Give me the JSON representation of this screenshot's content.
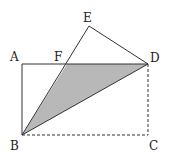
{
  "diagram": {
    "type": "geometry",
    "points": {
      "A": {
        "label": "A",
        "x": 22,
        "y": 64
      },
      "B": {
        "label": "B",
        "x": 22,
        "y": 135
      },
      "C": {
        "label": "C",
        "x": 148,
        "y": 135
      },
      "D": {
        "label": "D",
        "x": 148,
        "y": 64
      },
      "E": {
        "label": "E",
        "x": 89,
        "y": 26
      },
      "F": {
        "label": "F",
        "x": 67,
        "y": 64
      }
    },
    "labels": {
      "A": "A",
      "B": "B",
      "C": "C",
      "D": "D",
      "E": "E",
      "F": "F"
    },
    "solid_segments": [
      "AB",
      "AD",
      "BE",
      "ED",
      "BD"
    ],
    "dashed_segments": [
      "BC",
      "CD"
    ],
    "shaded_region": [
      "F",
      "B",
      "D"
    ],
    "colors": {
      "line": "#333333",
      "shade": "#b8b8b8",
      "background": "#ffffff"
    }
  }
}
